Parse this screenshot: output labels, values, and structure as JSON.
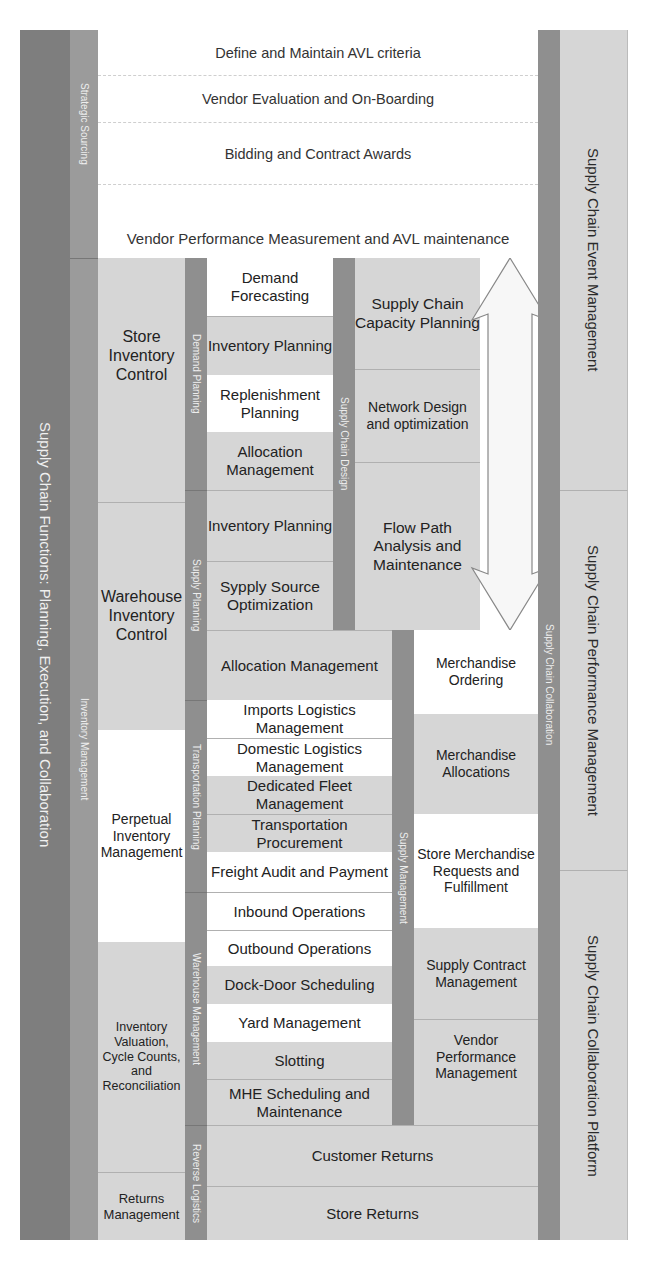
{
  "diagram": {
    "title": "Supply Chain Functions: Planning, Execution, and Collaboration",
    "left_bars": {
      "strategic_sourcing": "Strategic Sourcing",
      "inventory_management": "Inventory Management"
    },
    "strategic_sourcing_rows": [
      "Define and Maintain AVL criteria",
      "Vendor Evaluation and On-Boarding",
      "Bidding and Contract Awards",
      "Vendor Performance Measurement and AVL maintenance"
    ],
    "inventory_boxes": [
      "Store Inventory Control",
      "Warehouse Inventory Control",
      "Perpetual Inventory Management",
      "Inventory Valuation, Cycle Counts, and Reconciliation",
      "Returns Management"
    ],
    "mid_bars": {
      "demand_planning": "Demand Planning",
      "supply_planning": "Supply Planning",
      "transportation_planning": "Transportation Planning",
      "warehouse_management": "Warehouse Management",
      "reverse_logistics": "Reverse Logistics",
      "supply_chain_design": "Supply Chain Design",
      "supply_management": "Supply Management",
      "supply_chain_collaboration": "Supply Chain Collaboration"
    },
    "demand_planning_items": [
      "Demand Forecasting",
      "Inventory Planning",
      "Replenishment Planning",
      "Allocation Management"
    ],
    "supply_planning_items": [
      "Inventory Planning",
      "Sypply Source Optimization",
      "Allocation Management"
    ],
    "transportation_items": [
      "Imports Logistics Management",
      "Domestic Logistics Management",
      "Dedicated Fleet Management",
      "Transportation Procurement",
      "Freight Audit and Payment"
    ],
    "warehouse_items": [
      "Inbound Operations",
      "Outbound Operations",
      "Dock-Door Scheduling",
      "Yard Management",
      "Slotting",
      "MHE Scheduling and Maintenance"
    ],
    "reverse_logistics_items": [
      "Customer Returns",
      "Store Returns"
    ],
    "supply_chain_design_items": [
      "Supply Chain Capacity Planning",
      "Network Design and optimization",
      "Flow Path Analysis and Maintenance"
    ],
    "supply_management_items": [
      "Merchandise Ordering",
      "Merchandise Allocations",
      "Store Merchandise Requests and Fulfillment",
      "Supply Contract Management",
      "Vendor Performance Management"
    ],
    "right_columns": [
      "Supply Chain Event Management",
      "Supply Chain Performance Management",
      "Supply Chain Collaboration Platform"
    ],
    "arrow": "double-headed-vertical-arrow"
  }
}
